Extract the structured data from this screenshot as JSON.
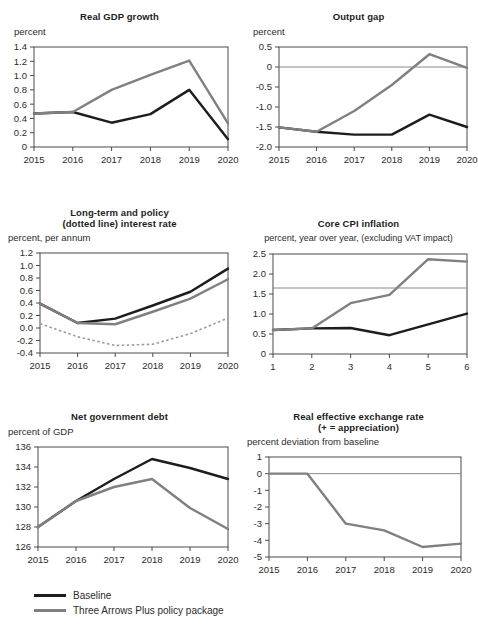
{
  "legend": {
    "items": [
      {
        "label": "Baseline",
        "color": "#1d1d1d",
        "style": "solid"
      },
      {
        "label": "Three Arrows Plus policy package",
        "color": "#808080",
        "style": "solid"
      }
    ]
  },
  "colors": {
    "baseline": "#1d1d1d",
    "policy": "#808080",
    "dotted": "#9a9a9a",
    "axis": "#4a4a4a",
    "reference": "#8a8a8a",
    "background": "#ffffff"
  },
  "chart_data": [
    {
      "type": "line",
      "id": "real-gdp-growth",
      "title": "Real GDP growth",
      "subtitle": "percent",
      "xlabel": "",
      "ylabel": "percent",
      "categories": [
        "2015",
        "2016",
        "2017",
        "2018",
        "2019",
        "2020"
      ],
      "x": [
        2015,
        2016,
        2017,
        2018,
        2019,
        2020
      ],
      "ylim": [
        0,
        1.4
      ],
      "yticks": [
        "0",
        "0.2",
        "0.4",
        "0.6",
        "0.8",
        "1.0",
        "1.2",
        "1.4"
      ],
      "ytickvals": [
        0,
        0.2,
        0.4,
        0.6,
        0.8,
        1.0,
        1.2,
        1.4
      ],
      "grid": false,
      "legend_position": "bottom-figure",
      "series": [
        {
          "name": "Baseline",
          "color": "#1d1d1d",
          "style": "solid",
          "values": [
            0.47,
            0.49,
            0.34,
            0.46,
            0.8,
            0.11
          ]
        },
        {
          "name": "Three Arrows Plus policy package",
          "color": "#808080",
          "style": "solid",
          "values": [
            0.47,
            0.49,
            0.8,
            1.01,
            1.21,
            0.33
          ]
        }
      ]
    },
    {
      "type": "line",
      "id": "output-gap",
      "title": "Output gap",
      "subtitle": "percent",
      "xlabel": "",
      "ylabel": "percent",
      "categories": [
        "2015",
        "2016",
        "2017",
        "2018",
        "2019",
        "2020"
      ],
      "x": [
        2015,
        2016,
        2017,
        2018,
        2019,
        2020
      ],
      "ylim": [
        -2.0,
        0.5
      ],
      "yticks": [
        "-2.0",
        "-1.5",
        "-1.0",
        "-0.5",
        "0",
        "0.5"
      ],
      "ytickvals": [
        -2.0,
        -1.5,
        -1.0,
        -0.5,
        0,
        0.5
      ],
      "grid": false,
      "reference_lines": [
        {
          "value": 0,
          "color": "#8a8a8a"
        }
      ],
      "series": [
        {
          "name": "Baseline",
          "color": "#1d1d1d",
          "style": "solid",
          "values": [
            -1.51,
            -1.62,
            -1.69,
            -1.69,
            -1.19,
            -1.5
          ]
        },
        {
          "name": "Three Arrows Plus policy package",
          "color": "#808080",
          "style": "solid",
          "values": [
            -1.51,
            -1.62,
            -1.1,
            -0.45,
            0.32,
            -0.02
          ]
        }
      ]
    },
    {
      "type": "line",
      "id": "interest-rate",
      "title": "Long-term and policy\n(dotted line) interest rate",
      "title_line1": "Long-term and policy",
      "title_line2": "(dotted line) interest rate",
      "subtitle": "percent, per annum",
      "xlabel": "",
      "ylabel": "percent, per annum",
      "categories": [
        "2015",
        "2016",
        "2017",
        "2018",
        "2019",
        "2020"
      ],
      "x": [
        2015,
        2016,
        2017,
        2018,
        2019,
        2020
      ],
      "ylim": [
        -0.4,
        1.2
      ],
      "yticks": [
        "-0.4",
        "-0.2",
        "0.0",
        "0.2",
        "0.4",
        "0.6",
        "0.8",
        "1.0",
        "1.2"
      ],
      "ytickvals": [
        -0.4,
        -0.2,
        0.0,
        0.2,
        0.4,
        0.6,
        0.8,
        1.0,
        1.2
      ],
      "grid": false,
      "series": [
        {
          "name": "Baseline",
          "color": "#1d1d1d",
          "style": "solid",
          "values": [
            0.39,
            0.08,
            0.15,
            0.36,
            0.58,
            0.95
          ]
        },
        {
          "name": "Three Arrows Plus policy package",
          "color": "#808080",
          "style": "solid",
          "values": [
            0.39,
            0.08,
            0.06,
            0.26,
            0.47,
            0.78
          ]
        },
        {
          "name": "Policy rate (dotted)",
          "color": "#9a9a9a",
          "style": "dotted",
          "values": [
            0.07,
            -0.14,
            -0.28,
            -0.26,
            -0.09,
            0.16
          ]
        }
      ]
    },
    {
      "type": "line",
      "id": "core-cpi-inflation",
      "title": "Core CPI inflation",
      "subtitle": "percent, year over year, (excluding VAT impact)",
      "xlabel": "",
      "ylabel": "percent, year over year, (excluding VAT impact)",
      "categories": [
        "1",
        "2",
        "3",
        "4",
        "5",
        "6"
      ],
      "x": [
        1,
        2,
        3,
        4,
        5,
        6
      ],
      "ylim": [
        0,
        2.5
      ],
      "yticks": [
        "0",
        "0.5",
        "1.0",
        "1.5",
        "2.0",
        "2.5"
      ],
      "ytickvals": [
        0,
        0.5,
        1.0,
        1.5,
        2.0,
        2.5
      ],
      "grid": false,
      "reference_lines": [
        {
          "value": 1.65,
          "color": "#8a8a8a"
        }
      ],
      "series": [
        {
          "name": "Baseline",
          "color": "#1d1d1d",
          "style": "solid",
          "values": [
            0.6,
            0.64,
            0.65,
            0.47,
            0.74,
            1.01
          ]
        },
        {
          "name": "Three Arrows Plus policy package",
          "color": "#808080",
          "style": "solid",
          "values": [
            0.6,
            0.64,
            1.27,
            1.48,
            2.37,
            2.31
          ]
        }
      ]
    },
    {
      "type": "line",
      "id": "net-government-debt",
      "title": "Net government debt",
      "subtitle": "percent of GDP",
      "xlabel": "",
      "ylabel": "percent of GDP",
      "categories": [
        "2015",
        "2016",
        "2017",
        "2018",
        "2019",
        "2020"
      ],
      "x": [
        2015,
        2016,
        2017,
        2018,
        2019,
        2020
      ],
      "ylim": [
        126,
        136
      ],
      "yticks": [
        "126",
        "128",
        "130",
        "132",
        "134",
        "136"
      ],
      "ytickvals": [
        126,
        128,
        130,
        132,
        134,
        136
      ],
      "grid": false,
      "series": [
        {
          "name": "Baseline",
          "color": "#1d1d1d",
          "style": "solid",
          "values": [
            128.0,
            130.6,
            132.8,
            134.8,
            133.9,
            132.8
          ]
        },
        {
          "name": "Three Arrows Plus policy package",
          "color": "#808080",
          "style": "solid",
          "values": [
            128.0,
            130.6,
            132.0,
            132.8,
            129.9,
            127.8
          ]
        }
      ]
    },
    {
      "type": "line",
      "id": "real-effective-exchange-rate",
      "title": "Real effective exchange rate\n(+ = appreciation)",
      "title_line1": "Real effective exchange rate",
      "title_line2": "(+ = appreciation)",
      "subtitle": "percent deviation from baseline",
      "xlabel": "",
      "ylabel": "percent deviation from baseline",
      "categories": [
        "2015",
        "2016",
        "2017",
        "2018",
        "2019",
        "2020"
      ],
      "x": [
        2015,
        2016,
        2017,
        2018,
        2019,
        2020
      ],
      "ylim": [
        -5,
        1
      ],
      "yticks": [
        "-5",
        "-4",
        "-3",
        "-2",
        "-1",
        "0",
        "1"
      ],
      "ytickvals": [
        -5,
        -4,
        -3,
        -2,
        -1,
        0,
        1
      ],
      "grid": false,
      "reference_lines": [
        {
          "value": 0,
          "color": "#8a8a8a"
        }
      ],
      "series": [
        {
          "name": "Three Arrows Plus policy package",
          "color": "#808080",
          "style": "solid",
          "values": [
            0.0,
            0.0,
            -3.0,
            -3.4,
            -4.4,
            -4.2
          ]
        }
      ]
    }
  ]
}
